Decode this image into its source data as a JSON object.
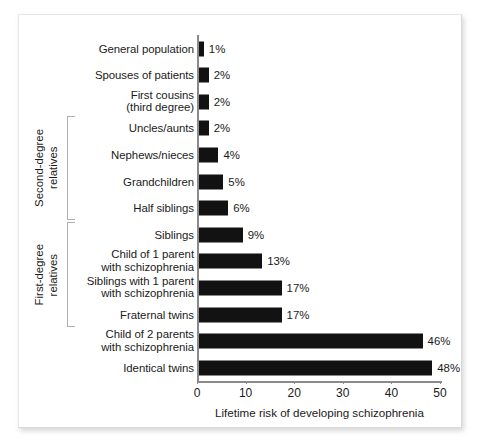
{
  "chart_data": {
    "type": "bar",
    "orientation": "horizontal",
    "title": "",
    "xlabel": "Lifetime risk of developing schizophrenia",
    "ylabel": "",
    "xlim": [
      0,
      50
    ],
    "xticks": [
      0,
      10,
      20,
      30,
      40,
      50
    ],
    "xtick_labels": [
      "0",
      "10",
      "20",
      "30",
      "40",
      "50"
    ],
    "grid": false,
    "legend": null,
    "bar_color": "#121212",
    "axis_color": "#8a8a8a",
    "categories": [
      "General population",
      "Spouses of patients",
      "First cousins\n(third degree)",
      "Uncles/aunts",
      "Nephews/nieces",
      "Grandchildren",
      "Half siblings",
      "Siblings",
      "Child of 1 parent\nwith schizophrenia",
      "Siblings with 1 parent\nwith schizophrenia",
      "Fraternal twins",
      "Child of 2 parents\nwith schizophrenia",
      "Identical twins"
    ],
    "values": [
      1,
      2,
      2,
      2,
      4,
      5,
      6,
      9,
      13,
      17,
      17,
      46,
      48
    ],
    "data_labels": [
      "1%",
      "2%",
      "2%",
      "2%",
      "4%",
      "5%",
      "6%",
      "9%",
      "13%",
      "17%",
      "17%",
      "46%",
      "48%"
    ],
    "groups": [
      {
        "label": "Second-degree\nrelatives",
        "first_index": 3,
        "last_index": 6
      },
      {
        "label": "First-degree\nrelatives",
        "first_index": 7,
        "last_index": 10
      }
    ]
  }
}
